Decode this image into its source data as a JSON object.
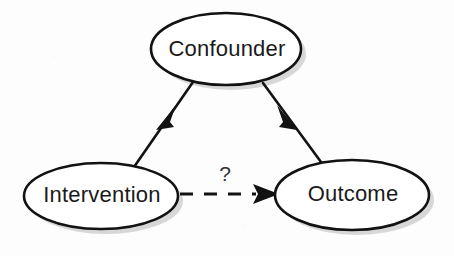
{
  "diagram": {
    "type": "directed-acyclic-graph",
    "background_color": "#fdfdfd",
    "stroke_color": "#121212",
    "node_fill_color": "#ffffff",
    "shadow_color": "#b8b8b8",
    "nodes": [
      {
        "id": "confounder",
        "label": "Confounder",
        "shape": "ellipse",
        "cx": 226,
        "cy": 49,
        "rx": 75,
        "ry": 36
      },
      {
        "id": "intervention",
        "label": "Intervention",
        "shape": "ellipse",
        "cx": 101,
        "cy": 196,
        "rx": 77,
        "ry": 33
      },
      {
        "id": "outcome",
        "label": "Outcome",
        "shape": "ellipse",
        "cx": 352,
        "cy": 195,
        "rx": 77,
        "ry": 35
      }
    ],
    "edges": [
      {
        "id": "confounder-to-intervention",
        "from": "confounder",
        "to": "intervention",
        "style": "solid",
        "arrow": "filled-triangle",
        "label": ""
      },
      {
        "id": "confounder-to-outcome",
        "from": "confounder",
        "to": "outcome",
        "style": "solid",
        "arrow": "filled-triangle",
        "label": ""
      },
      {
        "id": "intervention-to-outcome",
        "from": "intervention",
        "to": "outcome",
        "style": "dashed",
        "arrow": "filled-triangle",
        "label": "?"
      }
    ]
  }
}
